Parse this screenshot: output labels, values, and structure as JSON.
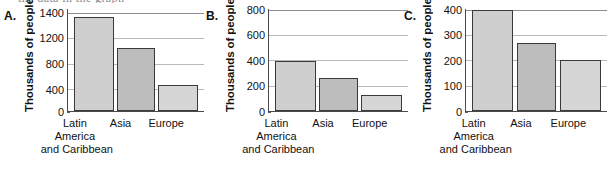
{
  "cropped_caption": "the data in the graph",
  "chart_data": [
    {
      "type": "bar",
      "panel": "A.",
      "title": "",
      "xlabel": "",
      "ylabel": "Thousands of people",
      "categories": [
        "Latin America and Caribbean",
        "Asia",
        "Europe"
      ],
      "category_lines": [
        [
          "Latin",
          "America",
          "and Caribbean"
        ],
        [
          "Asia",
          "",
          ""
        ],
        [
          "Europe",
          "",
          ""
        ]
      ],
      "values": [
        1310,
        880,
        355
      ],
      "ticks": [
        0,
        400,
        800,
        1200,
        1400
      ],
      "tick_labels": [
        "0",
        "400",
        "800",
        "1200",
        "1400"
      ],
      "ylim": [
        0,
        1400
      ],
      "grid": true,
      "legend": "none",
      "bar_colors": [
        "#cfcfcf",
        "#bdbdbd",
        "#d6d6d6"
      ]
    },
    {
      "type": "bar",
      "panel": "B.",
      "title": "",
      "xlabel": "",
      "ylabel": "Thousands of people",
      "categories": [
        "Latin America and Caribbean",
        "Asia",
        "Europe"
      ],
      "category_lines": [
        [
          "Latin",
          "America",
          "and Caribbean"
        ],
        [
          "Asia",
          "",
          ""
        ],
        [
          "Europe",
          "",
          ""
        ]
      ],
      "values": [
        400,
        265,
        125
      ],
      "ticks": [
        0,
        200,
        400,
        600,
        800
      ],
      "tick_labels": [
        "0",
        "200",
        "400",
        "600",
        "800"
      ],
      "ylim": [
        0,
        800
      ],
      "grid": true,
      "legend": "none",
      "bar_colors": [
        "#cfcfcf",
        "#bdbdbd",
        "#d6d6d6"
      ]
    },
    {
      "type": "bar",
      "panel": "C.",
      "title": "",
      "xlabel": "",
      "ylabel": "Thousands of people",
      "categories": [
        "Latin America and Caribbean",
        "Asia",
        "Europe"
      ],
      "category_lines": [
        [
          "Latin",
          "America",
          "and Caribbean"
        ],
        [
          "Asia",
          "",
          ""
        ],
        [
          "Europe",
          "",
          ""
        ]
      ],
      "values": [
        400,
        270,
        202
      ],
      "ticks": [
        0,
        100,
        200,
        300,
        400
      ],
      "tick_labels": [
        "0",
        "100",
        "200",
        "300",
        "400"
      ],
      "ylim": [
        0,
        400
      ],
      "grid": true,
      "legend": "none",
      "bar_colors": [
        "#cfcfcf",
        "#bdbdbd",
        "#d6d6d6"
      ]
    }
  ]
}
